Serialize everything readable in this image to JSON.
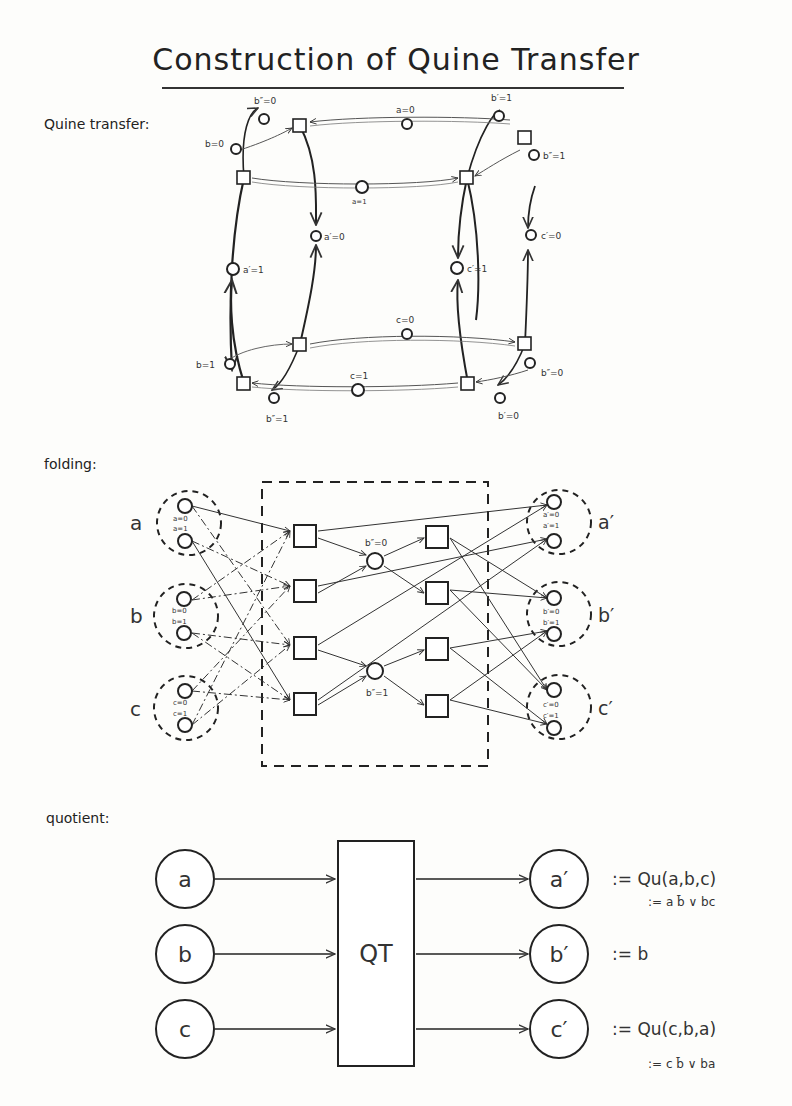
{
  "title": "Construction of Quine Transfer",
  "sections": {
    "quine_transfer": {
      "label": "Quine transfer:",
      "places": {
        "b_pp_0": "b″=0",
        "b_0": "b=0",
        "a_0": "a=0",
        "b_p_1": "b′=1",
        "b_pp_1_top": "b″=1",
        "a_1": "a=1",
        "a_p_0": "a′=0",
        "a_p_1": "a′=1",
        "c_p_1": "c′=1",
        "c_p_0": "c′=0",
        "c_0": "c=0",
        "c_1": "c=1",
        "b_1": "b=1",
        "b_pp_1": "b″=1",
        "b_p_0": "b′=0"
      }
    },
    "folding": {
      "label": "folding:",
      "inputs": [
        {
          "group": "a",
          "values": [
            "a=0",
            "a=1"
          ]
        },
        {
          "group": "b",
          "values": [
            "b=0",
            "b=1"
          ]
        },
        {
          "group": "c",
          "values": [
            "c=0",
            "c=1"
          ]
        }
      ],
      "internal_places": [
        "b″=0",
        "b″=1"
      ],
      "outputs": [
        {
          "group": "a′",
          "values": [
            "a′=0",
            "a′=1"
          ]
        },
        {
          "group": "b′",
          "values": [
            "b′=0",
            "b′=1"
          ]
        },
        {
          "group": "c′",
          "values": [
            "c′=0",
            "c′=1"
          ]
        }
      ]
    },
    "quotient": {
      "label": "quotient:",
      "inputs": [
        "a",
        "b",
        "c"
      ],
      "box_label": "QT",
      "outputs": [
        "a′",
        "b′",
        "c′"
      ],
      "equations": [
        {
          "main": ":= Qu(a,b,c)",
          "sub": ":= a b̄ ∨ bc"
        },
        {
          "main": ":= b",
          "sub": ""
        },
        {
          "main": ":= Qu(c,b,a)",
          "sub": ":= c b̄ ∨ ba"
        }
      ]
    }
  }
}
